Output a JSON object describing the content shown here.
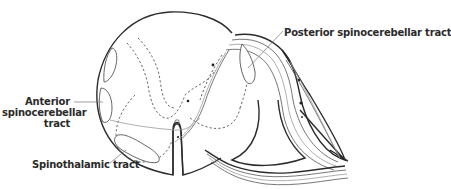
{
  "figure": {
    "labels": {
      "posterior_spinocerebellar": "Posterior spinocerebellar tract",
      "anterior_spinocerebellar_line1": "Anterior",
      "anterior_spinocerebellar_line2": "spinocerebellar",
      "anterior_spinocerebellar_line3": "tract",
      "spinothalamic": "Spinothalamic tract"
    },
    "colors": {
      "outline": "#2b2b2b",
      "fiber": "#555555",
      "fiber_light": "#9a9a9a",
      "label_text": "#2a2a2a",
      "background": "#ffffff"
    }
  }
}
